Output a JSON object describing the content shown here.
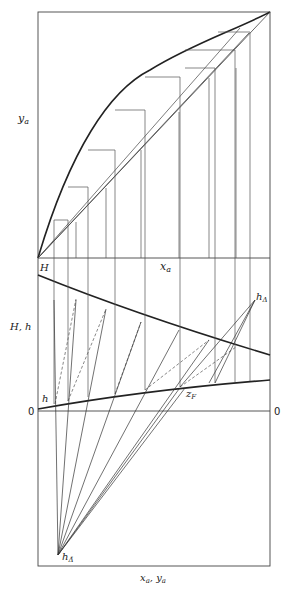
{
  "figure": {
    "type": "Ponchon-Savarit enthalpy-composition diagram with McCabe-Thiele x-y diagram",
    "labels": {
      "top_y_axis": "y_a",
      "top_x_axis": "x_a",
      "enthalpy_top": "H",
      "enthalpy_axis": "H, h",
      "liquid_curve": "h",
      "zero_left": "0",
      "zero_right": "0",
      "feed": "z_F",
      "delta_top": "h_Δ",
      "delta_bottom": "h_Δ̄",
      "bottom_x_axis": "x_a, y_a"
    }
  }
}
